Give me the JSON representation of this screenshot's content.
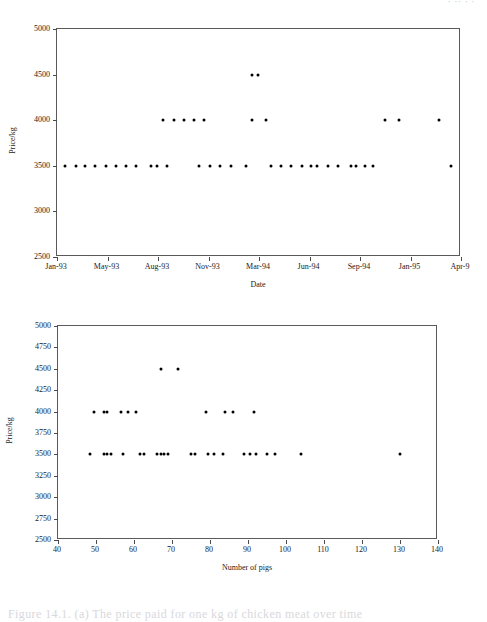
{
  "document": {
    "top_edge_text": "· ·· · ·",
    "bottom_edge_text": "Figure 14.1. (a) The price paid for one kg of chicken meat over time"
  },
  "figures": [
    {
      "name": "price-vs-date",
      "chart_data": {
        "type": "scatter",
        "title": "",
        "xlabel": "Date",
        "ylabel": "Price/kg",
        "grid": false,
        "legend": "none",
        "xtick_labels": [
          "Jan-93",
          "May-93",
          "Aug-93",
          "Nov-93",
          "Mar-94",
          "Jun-94",
          "Sep-94",
          "Jan-95",
          "Apr-9"
        ],
        "ylim": [
          2500,
          5000
        ],
        "ytick_labels": [
          "2500",
          "3000",
          "3500",
          "4000",
          "4500",
          "5000"
        ],
        "ytick_values": [
          2500,
          3000,
          3500,
          4000,
          4500,
          5000
        ],
        "xunit": "month-index",
        "xlim": [
          0,
          27
        ],
        "points": [
          {
            "x": 0.55,
            "y": 3500
          },
          {
            "x": 1.25,
            "y": 3500
          },
          {
            "x": 1.9,
            "y": 3500
          },
          {
            "x": 2.55,
            "y": 3500
          },
          {
            "x": 3.25,
            "y": 3500
          },
          {
            "x": 3.95,
            "y": 3500
          },
          {
            "x": 4.6,
            "y": 3500
          },
          {
            "x": 5.3,
            "y": 3500
          },
          {
            "x": 6.3,
            "y": 3500
          },
          {
            "x": 6.65,
            "y": 3500
          },
          {
            "x": 7.35,
            "y": 3500
          },
          {
            "x": 7.1,
            "y": 4000
          },
          {
            "x": 7.8,
            "y": 4000
          },
          {
            "x": 8.5,
            "y": 4000
          },
          {
            "x": 9.15,
            "y": 4000
          },
          {
            "x": 9.85,
            "y": 4000
          },
          {
            "x": 9.5,
            "y": 3500
          },
          {
            "x": 10.2,
            "y": 3500
          },
          {
            "x": 10.9,
            "y": 3500
          },
          {
            "x": 11.6,
            "y": 3500
          },
          {
            "x": 12.6,
            "y": 3500
          },
          {
            "x": 13.05,
            "y": 4500
          },
          {
            "x": 13.4,
            "y": 4500
          },
          {
            "x": 13.0,
            "y": 4000
          },
          {
            "x": 13.95,
            "y": 4000
          },
          {
            "x": 14.3,
            "y": 3500
          },
          {
            "x": 15.0,
            "y": 3500
          },
          {
            "x": 15.65,
            "y": 3500
          },
          {
            "x": 16.35,
            "y": 3500
          },
          {
            "x": 17.0,
            "y": 3500
          },
          {
            "x": 17.4,
            "y": 3500
          },
          {
            "x": 18.1,
            "y": 3500
          },
          {
            "x": 18.75,
            "y": 3500
          },
          {
            "x": 19.65,
            "y": 3500
          },
          {
            "x": 19.95,
            "y": 3500
          },
          {
            "x": 20.6,
            "y": 3500
          },
          {
            "x": 21.1,
            "y": 3500
          },
          {
            "x": 21.9,
            "y": 4000
          },
          {
            "x": 22.85,
            "y": 4000
          },
          {
            "x": 25.55,
            "y": 4000
          },
          {
            "x": 26.3,
            "y": 3500
          }
        ]
      }
    },
    {
      "name": "price-vs-number-of-pigs",
      "chart_data": {
        "type": "scatter",
        "title": "",
        "xlabel": "Number of pigs",
        "ylabel": "Price/kg",
        "grid": false,
        "legend": "none",
        "xlim": [
          40,
          140
        ],
        "xtick_values": [
          40,
          50,
          60,
          70,
          80,
          90,
          100,
          110,
          120,
          130,
          140
        ],
        "xtick_labels": [
          "40",
          "50",
          "60",
          "70",
          "80",
          "90",
          "100",
          "110",
          "120",
          "130",
          "140"
        ],
        "ylim": [
          2500,
          5000
        ],
        "ytick_values": [
          2500,
          2750,
          3000,
          3250,
          3500,
          3750,
          4000,
          4250,
          4500,
          4750,
          5000
        ],
        "ytick_labels": [
          "2500",
          "2750",
          "3000",
          "3250",
          "3500",
          "3750",
          "4000",
          "4250",
          "4500",
          "4750",
          "5000"
        ],
        "points": [
          {
            "x": 67,
            "y": 4500
          },
          {
            "x": 71.5,
            "y": 4500
          },
          {
            "x": 49.5,
            "y": 4000
          },
          {
            "x": 52,
            "y": 4000
          },
          {
            "x": 53,
            "y": 4000
          },
          {
            "x": 56.5,
            "y": 4000
          },
          {
            "x": 58.5,
            "y": 4000
          },
          {
            "x": 60.5,
            "y": 4000
          },
          {
            "x": 79,
            "y": 4000
          },
          {
            "x": 84,
            "y": 4000
          },
          {
            "x": 86,
            "y": 4000
          },
          {
            "x": 91.5,
            "y": 4000
          },
          {
            "x": 48.5,
            "y": 3500
          },
          {
            "x": 52,
            "y": 3500
          },
          {
            "x": 53,
            "y": 3500
          },
          {
            "x": 54,
            "y": 3500
          },
          {
            "x": 57,
            "y": 3500
          },
          {
            "x": 61.5,
            "y": 3500
          },
          {
            "x": 62.5,
            "y": 3500
          },
          {
            "x": 66,
            "y": 3500
          },
          {
            "x": 67,
            "y": 3500
          },
          {
            "x": 68,
            "y": 3500
          },
          {
            "x": 69,
            "y": 3500
          },
          {
            "x": 75,
            "y": 3500
          },
          {
            "x": 76,
            "y": 3500
          },
          {
            "x": 79.5,
            "y": 3500
          },
          {
            "x": 81,
            "y": 3500
          },
          {
            "x": 83.5,
            "y": 3500
          },
          {
            "x": 89,
            "y": 3500
          },
          {
            "x": 90.5,
            "y": 3500
          },
          {
            "x": 92,
            "y": 3500
          },
          {
            "x": 95,
            "y": 3500
          },
          {
            "x": 97,
            "y": 3500
          },
          {
            "x": 104,
            "y": 3500
          },
          {
            "x": 130,
            "y": 3500
          }
        ]
      }
    }
  ]
}
